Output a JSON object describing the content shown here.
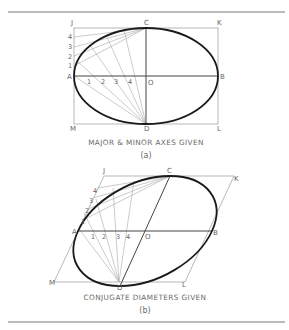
{
  "figure_a": {
    "caption": "MAJOR & MINOR AXES GIVEN",
    "sublabel": "(a)",
    "labels": {
      "J": "J",
      "C": "C",
      "K": "K",
      "A": "A",
      "B": "B",
      "O": "O",
      "M": "M",
      "D": "D",
      "L": "L"
    },
    "side_divisions": [
      "1",
      "2",
      "3",
      "4"
    ],
    "axis_divisions": [
      "1",
      "2",
      "3",
      "4"
    ]
  },
  "figure_b": {
    "caption": "CONJUGATE DIAMETERS GIVEN",
    "sublabel": "(b)",
    "labels": {
      "J": "J",
      "C": "C",
      "K": "K",
      "A": "A",
      "B": "B",
      "O": "O",
      "M": "M",
      "D": "D",
      "L": "L"
    },
    "side_divisions": [
      "1",
      "2",
      "3",
      "4"
    ],
    "axis_divisions": [
      "1",
      "2",
      "3",
      "4"
    ]
  },
  "colors": {
    "curve": "#1a1a1a",
    "construction": "#a8a8a8",
    "text": "#666666",
    "rule": "#777777"
  }
}
